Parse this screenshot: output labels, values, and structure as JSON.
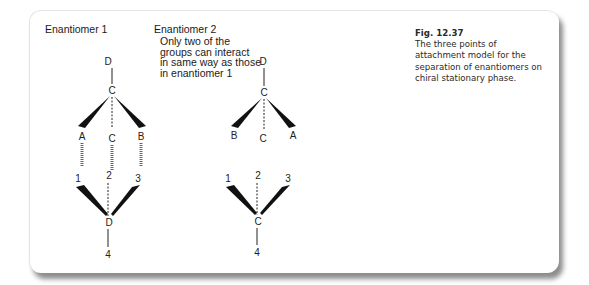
{
  "figure": {
    "number": "Fig. 12.37",
    "caption": "The three points of attachment model for the separation of enantiomers on chiral stationary phase."
  },
  "enantiomer1": {
    "title": "Enantiomer 1",
    "molecule": {
      "top": "D",
      "center": "C",
      "left": "A",
      "middle": "C",
      "right": "B"
    },
    "phase": {
      "left": "1",
      "middle": "2",
      "right": "3",
      "center": "D",
      "bottom": "4"
    }
  },
  "enantiomer2": {
    "title": "Enantiomer 2",
    "note_lines": [
      "Only two of the",
      "groups can interact",
      "in same way as those",
      "in enantiomer 1"
    ],
    "molecule": {
      "top": "D",
      "center": "C",
      "left": "B",
      "middle": "C",
      "right": "A"
    },
    "phase": {
      "left": "1",
      "middle": "2",
      "right": "3",
      "center": "C",
      "bottom": "4"
    }
  }
}
